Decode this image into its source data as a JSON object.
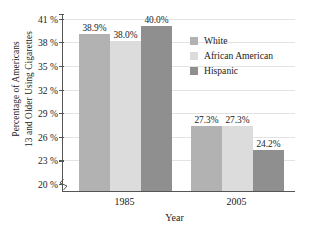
{
  "chart_data": {
    "type": "bar",
    "title": "",
    "xlabel": "Year",
    "ylabel": "Percentage of Americans 13 and Older Using Cigarettes",
    "ylabel_lines": [
      "Percentage of Americans",
      "13 and Older Using Cigarettes"
    ],
    "categories": [
      "1985",
      "2005"
    ],
    "series": [
      {
        "name": "White",
        "values": [
          38.9,
          27.3
        ],
        "color": "#b2b2b2",
        "labels": [
          "38.9%",
          "27.3%"
        ]
      },
      {
        "name": "African American",
        "values": [
          38.0,
          27.3
        ],
        "color": "#dcdcdc",
        "labels": [
          "38.0%",
          "27.3%"
        ]
      },
      {
        "name": "Hispanic",
        "values": [
          40.0,
          24.2
        ],
        "color": "#8f8f8f",
        "labels": [
          "40.0%",
          "24.2%"
        ]
      }
    ],
    "ylim": [
      19.0,
      41.6
    ],
    "yticks": [
      20,
      23,
      26,
      29,
      32,
      35,
      38,
      41
    ],
    "ytick_labels": [
      "20 %",
      "23 %",
      "26 %",
      "29 %",
      "32 %",
      "35 %",
      "38 %",
      "41 %"
    ],
    "grid": true,
    "grid_color": "#e3e3e3",
    "legend_position": "inside-top-right",
    "axis_break": true,
    "axis_color": "#555555",
    "background": "#ffffff"
  }
}
